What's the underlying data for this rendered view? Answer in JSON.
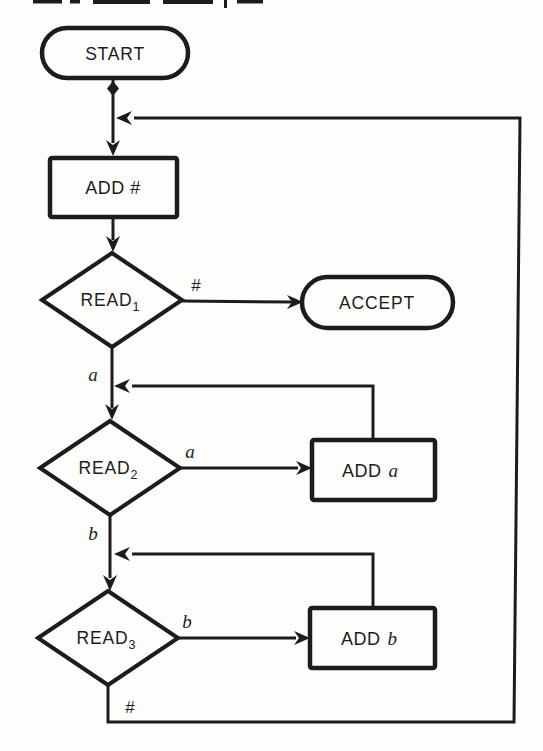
{
  "colors": {
    "ink": "#1c1c1c",
    "paper": "#fdfdfc"
  },
  "nodes": {
    "start": {
      "label": "START"
    },
    "add_hash": {
      "label": "ADD #"
    },
    "read1": {
      "base": "READ",
      "sub": "1"
    },
    "accept": {
      "label": "ACCEPT"
    },
    "read2": {
      "base": "READ",
      "sub": "2"
    },
    "add_a": {
      "prefix": "ADD",
      "var": "a"
    },
    "read3": {
      "base": "READ",
      "sub": "3"
    },
    "add_b": {
      "prefix": "ADD",
      "var": "b"
    }
  },
  "edge_labels": {
    "read1_to_accept": "#",
    "read1_to_read2": "a",
    "read2_to_add_a": "a",
    "read2_to_read3": "b",
    "read3_to_add_b": "b",
    "read3_loop": "#"
  }
}
